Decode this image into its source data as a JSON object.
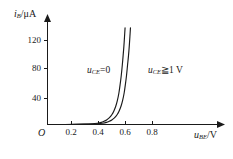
{
  "figure": {
    "background": "#ffffff",
    "ink": "#1a1a1a"
  },
  "axes": {
    "y_axis_label": "i",
    "y_axis_sub": "B",
    "y_axis_unit": "/μA",
    "x_axis_label": "u",
    "x_axis_sub": "BE",
    "x_axis_unit": "/V",
    "origin_label": "O"
  },
  "annotations": {
    "left": {
      "var": "u",
      "sub": "CE",
      "rel": "=0"
    },
    "right": {
      "var": "u",
      "sub": "CE",
      "rel": "≧1 V"
    }
  },
  "chart_data": {
    "type": "line",
    "title": "",
    "subtitle": "",
    "xlabel": "u_BE/V",
    "ylabel": "i_B/μA",
    "xlim": [
      0,
      0.95
    ],
    "ylim": [
      0,
      145
    ],
    "xticks": [
      0.2,
      0.4,
      0.6,
      0.8
    ],
    "xticklabels": [
      "0.2",
      "0.4",
      "0.6",
      "0.8"
    ],
    "yticks": [
      40,
      80,
      120
    ],
    "yticklabels": [
      "40",
      "80",
      "120"
    ],
    "grid": false,
    "legend_position": "inline-annotation",
    "series": [
      {
        "name": "u_CE=0",
        "label": "u_CE=0",
        "color": "#1a1a1a",
        "x": [
          0.0,
          0.1,
          0.2,
          0.28,
          0.34,
          0.38,
          0.41,
          0.43,
          0.45,
          0.47,
          0.49,
          0.505,
          0.52,
          0.532,
          0.544,
          0.554,
          0.562,
          0.57,
          0.576,
          0.582,
          0.587,
          0.591
        ],
        "y": [
          0.0,
          0.0,
          0.2,
          0.5,
          1.0,
          1.8,
          3.0,
          4.5,
          6.5,
          9.5,
          14.0,
          19.0,
          26.0,
          34.0,
          45.0,
          58.0,
          70.0,
          85.0,
          98.0,
          112.0,
          126.0,
          138.0
        ]
      },
      {
        "name": "u_CE>=1V",
        "label": "u_CE≧1 V",
        "color": "#1a1a1a",
        "x": [
          0.0,
          0.12,
          0.24,
          0.32,
          0.38,
          0.42,
          0.45,
          0.47,
          0.49,
          0.51,
          0.53,
          0.545,
          0.56,
          0.572,
          0.584,
          0.594,
          0.602,
          0.61,
          0.617,
          0.623,
          0.628,
          0.632
        ],
        "y": [
          0.0,
          0.0,
          0.2,
          0.5,
          1.0,
          1.8,
          3.0,
          4.5,
          6.5,
          9.5,
          14.0,
          19.0,
          26.0,
          34.0,
          45.0,
          58.0,
          70.0,
          85.0,
          98.0,
          112.0,
          126.0,
          138.0
        ]
      }
    ]
  }
}
